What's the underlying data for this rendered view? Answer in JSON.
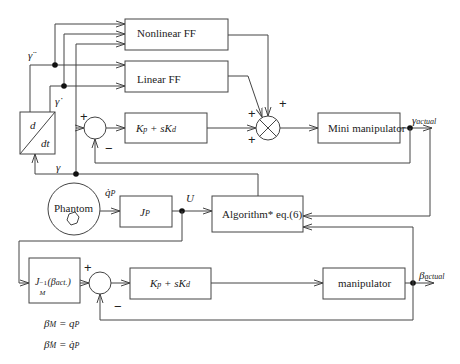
{
  "diagram": {
    "type": "control block diagram",
    "blocks": {
      "nonlinear_ff": "Nonlinear FF",
      "linear_ff": "Linear FF",
      "pd_top": {
        "main": "K",
        "p": "p",
        "plus": " + sK",
        "d": "d"
      },
      "mini_manipulator": "Mini manipulator",
      "differentiator": {
        "num": "d",
        "den": "dt"
      },
      "phantom": "Phantom",
      "jp": {
        "main": "J",
        "sub": "P"
      },
      "algorithm": "Algorithm* eq.(6)",
      "jm_inv": {
        "main": "J",
        "sub": "M",
        "sup": "−1",
        "arg_open": "(β",
        "arg_sub": "act.",
        "arg_close": ")"
      },
      "pd_bottom": {
        "main": "K",
        "p": "p",
        "plus": " + sK",
        "d": "d"
      },
      "manipulator": "manipulator"
    },
    "signals": {
      "gamma_ddot": "γ̈",
      "gamma_dot": "γ̇",
      "gamma": "γ",
      "gamma_actual": {
        "main": "γ",
        "sub": "actual"
      },
      "qp_dot": {
        "main": "q̇",
        "sub": "P"
      },
      "u_vec": "U⃗",
      "beta_actual": {
        "main": "β",
        "sub": "actual"
      }
    },
    "signs": {
      "sum_top_plus": "+",
      "sum_top_minus": "−",
      "mult_plus_left": "+",
      "mult_plus_right": "+",
      "mult_plus_bottom": "+",
      "sum_bottom_plus": "+",
      "sum_bottom_minus": "−"
    },
    "equations": [
      {
        "lhs": "β",
        "lhs_sub": "M",
        "rhs": " = q",
        "rhs_sub": "P"
      },
      {
        "lhs": "β̇",
        "lhs_sub": "M",
        "rhs": " = q̇",
        "rhs_sub": "P"
      }
    ],
    "colors": {
      "line": "#444444",
      "background": "#ffffff"
    }
  }
}
